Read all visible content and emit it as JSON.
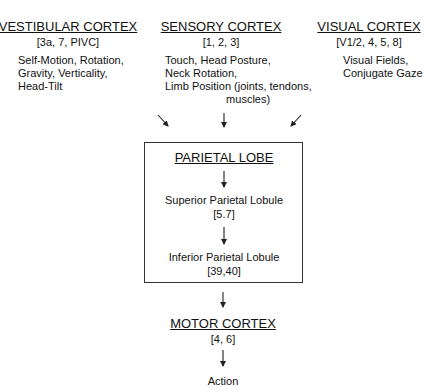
{
  "sources": [
    {
      "title": "VESTIBULAR CORTEX",
      "areas": "[3a, 7, PIVC]",
      "description": "Self-Motion, Rotation,\nGravity, Verticality,\nHead-Tilt"
    },
    {
      "title": "SENSORY CORTEX",
      "areas": "[1, 2, 3]",
      "description": "Touch, Head Posture,\nNeck Rotation,\nLimb Position (joints, tendons,\n                    muscles)"
    },
    {
      "title": "VISUAL CORTEX",
      "areas": "[V1/2, 4, 5, 8]",
      "description": "Visual Fields,\nConjugate Gaze"
    }
  ],
  "parietal": {
    "title": "PARIETAL LOBE",
    "superior": {
      "label": "Superior Parietal Lobule",
      "areas": "[5.7]"
    },
    "inferior": {
      "label": "Inferior Parietal Lobule",
      "areas": "[39,40]"
    }
  },
  "motor": {
    "title": "MOTOR CORTEX",
    "areas": "[4, 6]"
  },
  "output": {
    "label": "Action"
  },
  "colors": {
    "line": "#222222",
    "text": "#111111",
    "background": "#ffffff"
  }
}
